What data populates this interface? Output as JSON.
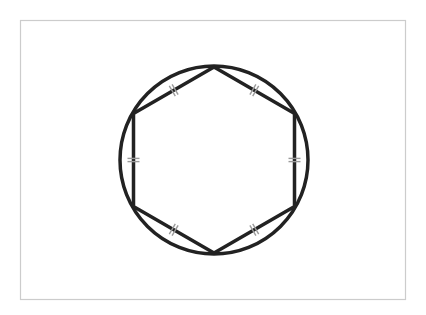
{
  "diagram": {
    "shapes": {
      "circle": {
        "label": "circumscribed circle"
      },
      "polygon": {
        "label": "regular hexagon",
        "sides": 6
      }
    },
    "tick_marks": {
      "per_side": 2,
      "meaning": "all sides congruent"
    },
    "colors": {
      "stroke": "#222222",
      "tick": "#9a9a9a",
      "frame": "#cccccc",
      "background": "#ffffff"
    }
  }
}
